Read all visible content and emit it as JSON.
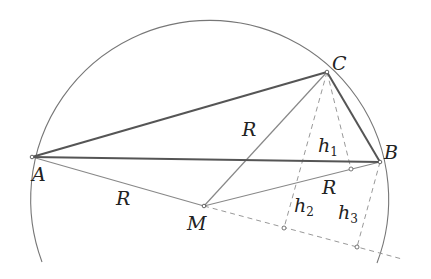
{
  "diagram": {
    "title": "",
    "colors": {
      "background": "#ffffff",
      "circle": "#777777",
      "triangle": "#555555",
      "radius": "#888888",
      "dashed": "#999999",
      "text": "#222222"
    },
    "points": {
      "A": {
        "label": "A",
        "x": 32,
        "y": 157
      },
      "B": {
        "label": "B",
        "x": 380,
        "y": 162
      },
      "C": {
        "label": "C",
        "x": 327,
        "y": 72
      },
      "M": {
        "label": "M",
        "x": 204,
        "y": 206
      }
    },
    "circle": {
      "cx": 204,
      "cy": 206,
      "r": 179
    },
    "segment_labels": {
      "R_MC": "R",
      "R_MA": "R",
      "R_MB": "R"
    },
    "heights": {
      "h1": {
        "base": "h",
        "sub": "1"
      },
      "h2": {
        "base": "h",
        "sub": "2"
      },
      "h3": {
        "base": "h",
        "sub": "3"
      }
    }
  }
}
